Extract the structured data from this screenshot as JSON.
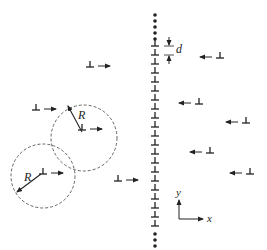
{
  "diagram": {
    "wall": {
      "x": 155,
      "spacing_label": "d",
      "dislocation_ys": [
        46,
        55,
        64,
        73,
        82,
        91,
        100,
        109,
        118,
        127,
        136,
        145,
        154,
        163,
        172,
        181,
        190,
        199,
        208,
        217,
        226
      ],
      "dots_top_ys": [
        15,
        21,
        27,
        33,
        39
      ],
      "dots_bottom_ys": [
        234,
        240,
        246
      ]
    },
    "mobile_dislocations_left": [
      {
        "x": 90,
        "y": 67,
        "direction": "right"
      },
      {
        "x": 36,
        "y": 110,
        "direction": "right"
      },
      {
        "x": 82,
        "y": 130,
        "direction": "right"
      },
      {
        "x": 43,
        "y": 174,
        "direction": "right"
      },
      {
        "x": 118,
        "y": 181,
        "direction": "right"
      }
    ],
    "mobile_dislocations_right": [
      {
        "x": 220,
        "y": 58,
        "direction": "left"
      },
      {
        "x": 199,
        "y": 104,
        "direction": "left"
      },
      {
        "x": 246,
        "y": 123,
        "direction": "left"
      },
      {
        "x": 210,
        "y": 153,
        "direction": "left"
      },
      {
        "x": 250,
        "y": 174,
        "direction": "left"
      }
    ],
    "circles": [
      {
        "cx": 84,
        "cy": 138,
        "r": 33,
        "label": "R",
        "radius_label": "R"
      },
      {
        "cx": 43,
        "cy": 176,
        "r": 32,
        "label": "R",
        "radius_label": "R"
      }
    ],
    "axes": {
      "x_label": "x",
      "y_label": "y",
      "origin_x": 179,
      "origin_y": 219
    }
  }
}
